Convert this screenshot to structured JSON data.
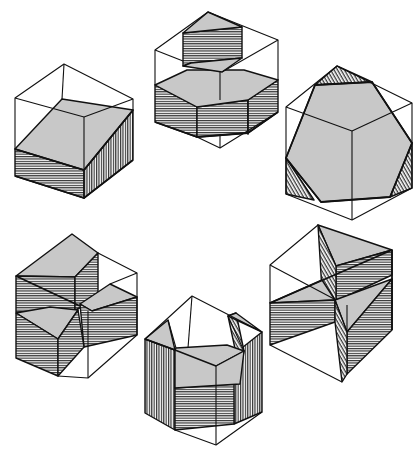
{
  "figure": {
    "description": "Six cubes shown in isometric projection, each sliced by planes that expose shaded cross-sections (gray) and hatched cut faces",
    "colors": {
      "section_fill": "#c8c8c8",
      "line": "#111111",
      "background": "#ffffff"
    },
    "hatching": [
      "horizontal",
      "vertical",
      "diagonal"
    ],
    "cubes": [
      {
        "id": "top-left",
        "section": "oblique quadrilateral (rectangle)",
        "cut_faces": [
          "front-left horizontal hatch",
          "front-right vertical hatch"
        ]
      },
      {
        "id": "top-center",
        "section": "two stacked parallel sections: quadrilateral above, hexagonal slab below",
        "cut_faces": [
          "horizontal hatch on slab faces"
        ]
      },
      {
        "id": "top-right",
        "section": "regular hexagon through cube center",
        "cut_faces": [
          "corner triangles hatched"
        ]
      },
      {
        "id": "bottom-left",
        "section": "three-blade pinwheel of rectangular slabs",
        "cut_faces": [
          "horizontal hatch"
        ]
      },
      {
        "id": "bottom-center",
        "section": "pentagonal prism",
        "cut_faces": [
          "vertical hatch sides",
          "horizontal hatch front"
        ]
      },
      {
        "id": "bottom-right",
        "section": "star-like arrangement of triangular wedges",
        "cut_faces": [
          "horizontal and diagonal hatch"
        ]
      }
    ]
  }
}
